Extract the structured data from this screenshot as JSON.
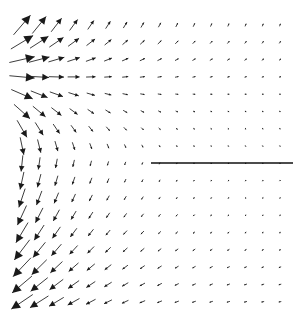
{
  "figure": {
    "title": "",
    "background_color": "#ffffff",
    "width": 301,
    "height": 314
  },
  "chart_data": {
    "type": "quiver",
    "title": "",
    "subtitle": "",
    "xlabel": "",
    "ylabel": "",
    "xlim": [
      0,
      301
    ],
    "ylim": [
      0,
      314
    ],
    "grid": false,
    "legend": null,
    "annotations": [
      {
        "name": "interface-line",
        "kind": "horizontal-line",
        "x_start": 151,
        "x_end": 293,
        "y": 163,
        "color": "#111111",
        "width": 1.5
      }
    ],
    "field": {
      "description": "Two-dimensional vector field of arrows on a regular grid; arrow length decays toward the right and direction rotates from up-right at the top through downward at mid-left to down-right at the bottom.",
      "arrow_color": "#1a1a1a",
      "grid": {
        "columns": 16,
        "rows": 17,
        "x_origin": 22,
        "y_origin": 25,
        "dx": 17.2,
        "dy": 17.3
      },
      "model": {
        "decay_scale_px": 62,
        "max_arrow_length_px": 26,
        "min_arrow_length_px": 1.2,
        "rotation_center_y": 163,
        "rotation_span_px": 150,
        "top_angle_deg": -62,
        "mid_angle_deg": 96,
        "bottom_angle_deg": 150,
        "head_length_ratio": 0.34,
        "head_width_ratio": 0.17
      }
    }
  }
}
